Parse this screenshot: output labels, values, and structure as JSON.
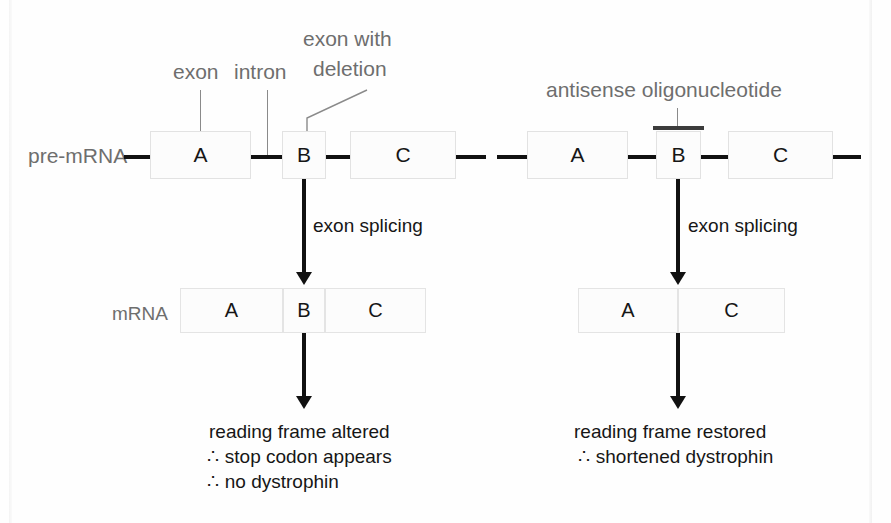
{
  "figure": {
    "colors": {
      "background": "#fefefe",
      "label_gray": "#6e6e6e",
      "text_black": "#161616",
      "connector_black": "#111111",
      "box_border": "#e2e2e2",
      "box_fill": "#fcfcfc",
      "aso_bar": "#3c3c3c",
      "leader_gray": "#8a8a8a"
    }
  },
  "row_labels": {
    "pre_mrna": "pre-mRNA",
    "mrna": "mRNA"
  },
  "callouts": {
    "exon": "exon",
    "intron": "intron",
    "exon_with_deletion_line1": "exon with",
    "exon_with_deletion_line2": "deletion",
    "antisense": "antisense oligonucleotide"
  },
  "process_labels": {
    "splicing_left": "exon splicing",
    "splicing_right": "exon splicing"
  },
  "left_panel": {
    "pre_mrna_exons": [
      "A",
      "B",
      "C"
    ],
    "mrna_exons": [
      "A",
      "B",
      "C"
    ],
    "outcome": {
      "line1": "reading frame altered",
      "line2_symbol": "∴",
      "line2": "stop codon appears",
      "line3_symbol": "∴",
      "line3": "no dystrophin"
    }
  },
  "right_panel": {
    "pre_mrna_exons": [
      "A",
      "B",
      "C"
    ],
    "mrna_exons": [
      "A",
      "C"
    ],
    "outcome": {
      "line1": "reading frame restored",
      "line2_symbol": "∴",
      "line2": "shortened dystrophin"
    }
  }
}
